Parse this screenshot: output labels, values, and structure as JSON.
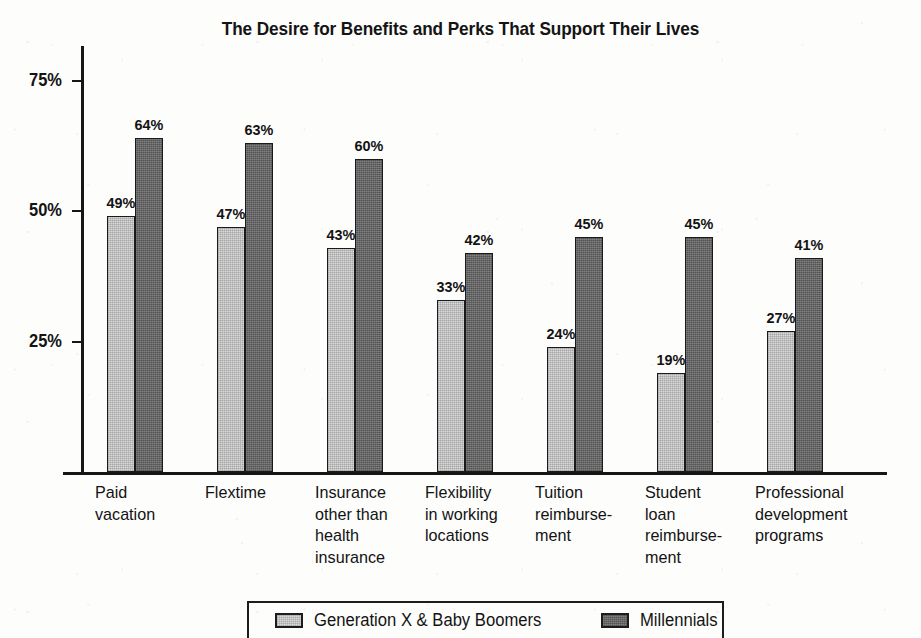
{
  "chart_data": {
    "type": "bar",
    "title": "The Desire for Benefits and Perks That Support Their Lives",
    "xlabel": "",
    "ylabel": "",
    "ylim": [
      0,
      82
    ],
    "yticks": [
      25,
      50,
      75
    ],
    "ytick_labels": [
      "25%",
      "50%",
      "75%"
    ],
    "grid": false,
    "legend_position": "bottom",
    "value_label_suffix": "%",
    "categories": [
      "Paid\nvacation",
      "Flextime",
      "Insurance\nother than\nhealth\ninsurance",
      "Flexibility\nin working\nlocations",
      "Tuition\nreimburse-\nment",
      "Student\nloan\nreimburse-\nment",
      "Professional\ndevelopment\nprograms"
    ],
    "series": [
      {
        "name": "Generation X & Baby Boomers",
        "color": "#d9d9d9",
        "values": [
          49,
          47,
          43,
          33,
          24,
          19,
          27
        ],
        "labels": [
          "49%",
          "47%",
          "43%",
          "33%",
          "24%",
          "19%",
          "27%"
        ]
      },
      {
        "name": "Millennials",
        "color": "#6d6d6d",
        "values": [
          64,
          63,
          60,
          42,
          45,
          45,
          41
        ],
        "labels": [
          "64%",
          "63%",
          "60%",
          "42%",
          "45%",
          "45%",
          "41%"
        ]
      }
    ]
  },
  "legend": {
    "items": [
      {
        "label": "Generation X & Baby Boomers",
        "swatch": "light"
      },
      {
        "label": "Millennials",
        "swatch": "dark"
      }
    ]
  }
}
